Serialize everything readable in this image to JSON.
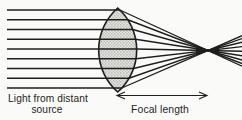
{
  "diagram": {
    "type": "optics-ray-diagram",
    "labels": {
      "source_line1": "Light from distant",
      "source_line2": "source",
      "focal_length": "Focal length"
    },
    "colors": {
      "background": "#fafaf8",
      "ink": "#1e1e1e",
      "lens_fill_base": "#e3e3e0",
      "lens_dot": "#96968e",
      "lens_dot2": "#a6a69e"
    },
    "lens": {
      "cx": 117.7,
      "cy": 50,
      "top_y": 8,
      "bottom_y": 92,
      "half_width": 19,
      "arc_radius": 55.9
    },
    "rays": {
      "start_x": 7,
      "end_x": 242,
      "y_positions": [
        10,
        19.75,
        29.5,
        39.25,
        49,
        58.75,
        68.5,
        78.25,
        88
      ]
    },
    "focal_point": {
      "x": 208,
      "y": 50.5
    },
    "focus_blob": {
      "left": "196,47.2 208,50.5 196,54.3",
      "right": "219,45.8 208,50.5 219,55.6"
    },
    "arrow": {
      "x1": 117,
      "x2": 207,
      "y": 95.5,
      "head_len": 8,
      "head_half": 3.4
    },
    "text_layout": {
      "source_line1_x": 8,
      "source_line1_y": 101.5,
      "source_line1_size": 10.2,
      "source_line2_x": 47,
      "source_line2_y": 113,
      "source_line2_size": 10.2,
      "focal_x": 160,
      "focal_y": 112.5,
      "focal_size": 10.4
    }
  }
}
